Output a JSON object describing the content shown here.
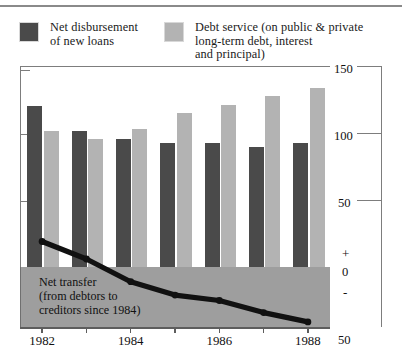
{
  "chart_data": {
    "type": "bar",
    "title": "",
    "subtitle": "",
    "xlabel": "",
    "ylabel": "",
    "categories": [
      "1982",
      "1983",
      "1984",
      "1985",
      "1986",
      "1987",
      "1988"
    ],
    "tick_labels_shown": [
      "1982",
      "1984",
      "1986",
      "1988"
    ],
    "series": [
      {
        "name": "Net disbursement of new loans",
        "color": "#4a4a4a",
        "values": [
          121,
          102,
          96,
          93,
          93,
          90,
          93
        ]
      },
      {
        "name": "Debt service (on public & private long-term debt, interest and principal)",
        "color": "#b3b3b3",
        "values": [
          102,
          96,
          104,
          116,
          122,
          128,
          134
        ]
      }
    ],
    "overlay_line": {
      "name": "Net transfer (from debtors to creditors since 1984)",
      "color": "#111111",
      "x": [
        "1982",
        "1983",
        "1984",
        "1985",
        "1986",
        "1987",
        "1988"
      ],
      "values": [
        19,
        6,
        -11,
        -21,
        -25,
        -34,
        -41
      ]
    },
    "ylim": [
      -50,
      150
    ],
    "yticks": [
      150,
      100,
      50,
      0,
      -50
    ],
    "ytick_labels": [
      "150",
      "100",
      "50",
      "0",
      "50"
    ],
    "sign_markers": [
      "+",
      "-"
    ],
    "grid": false,
    "legend_position": "top"
  },
  "legend": {
    "entries": [
      {
        "label": "Net disbursement\nof new loans",
        "color": "#4a4a4a",
        "swatch_name": "legend-swatch-dark"
      },
      {
        "label": "Debt service (on public & private\nlong-term debt, interest\nand principal)",
        "color": "#b3b3b3",
        "swatch_name": "legend-swatch-light"
      }
    ]
  },
  "annotations": {
    "net_transfer_caption": "Net transfer\n(from debtors to\ncreditors since 1984)"
  },
  "axis": {
    "right_labels": [
      "150",
      "100",
      "50",
      "0",
      "50"
    ],
    "plus_sign": "+",
    "minus_sign": "-",
    "x_labels": [
      "1982",
      "1984",
      "1986",
      "1988"
    ]
  },
  "colors": {
    "dark_bar": "#4a4a4a",
    "light_bar": "#b3b3b3",
    "negative_band": "#9e9e9e",
    "line": "#111111",
    "axis": "#7d7d7d"
  }
}
